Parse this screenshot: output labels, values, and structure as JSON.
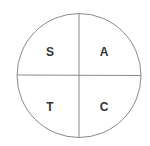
{
  "diagram": {
    "type": "quadrant-circle",
    "center": [
      79,
      75.5
    ],
    "radius": 62,
    "line_color": "#8a8a8a",
    "label_color": "#333333",
    "quadrants": [
      {
        "position": "top-left",
        "label": "S",
        "x": 50,
        "y": 52
      },
      {
        "position": "top-right",
        "label": "A",
        "x": 104,
        "y": 52
      },
      {
        "position": "bottom-left",
        "label": "T",
        "x": 50,
        "y": 107
      },
      {
        "position": "bottom-right",
        "label": "C",
        "x": 104,
        "y": 107
      }
    ]
  }
}
